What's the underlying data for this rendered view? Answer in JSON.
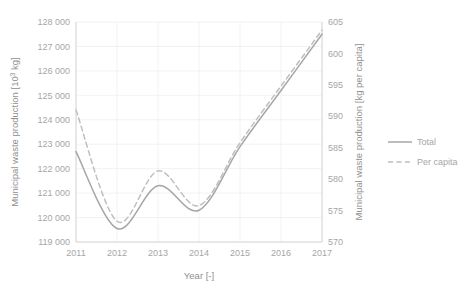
{
  "chart_data": {
    "type": "line",
    "title": "",
    "xlabel": "Year [-]",
    "ylabel": "Municipal waste production [10³ kg]",
    "ylabel_main": "Municipal waste production [10",
    "ylabel_sup": "3",
    "ylabel_tail": " kg]",
    "y2label": "Municipal waste production [kg per capita]",
    "x": [
      2011,
      2012,
      2013,
      2014,
      2015,
      2016,
      2017
    ],
    "categories": [
      "2011",
      "2012",
      "2013",
      "2014",
      "2015",
      "2016",
      "2017"
    ],
    "xtick_labels": [
      "2011",
      "2012",
      "2013",
      "2014",
      "2015",
      "2016",
      "2017"
    ],
    "ytick_labels": [
      "128 000",
      "127 000",
      "126 000",
      "125 000",
      "124 000",
      "123 000",
      "122 000",
      "121 000",
      "120 000",
      "119 000"
    ],
    "ytick_values": [
      128000,
      127000,
      126000,
      125000,
      124000,
      123000,
      122000,
      121000,
      120000,
      119000
    ],
    "y2tick_labels": [
      "605",
      "600",
      "595",
      "590",
      "585",
      "580",
      "575",
      "570"
    ],
    "y2tick_values": [
      605,
      600,
      595,
      590,
      585,
      580,
      575,
      570
    ],
    "ylim": [
      119000,
      128000
    ],
    "y2lim": [
      570,
      605
    ],
    "xlim": [
      2011,
      2017
    ],
    "grid": true,
    "legend_position": "right",
    "series": [
      {
        "name": "Total",
        "label": "Total",
        "axis": "left",
        "style": "solid",
        "color": "#a6a6a6",
        "values": [
          122700,
          119550,
          121300,
          120300,
          122900,
          125200,
          127500
        ]
      },
      {
        "name": "Per capita",
        "label": "Per capita",
        "axis": "right",
        "style": "dashed",
        "color": "#bfbfbf",
        "values": [
          591.0,
          573.3,
          581.3,
          575.8,
          585.8,
          594.8,
          603.7
        ]
      }
    ],
    "legend": [
      {
        "label": "Total",
        "style": "solid",
        "color": "#a6a6a6"
      },
      {
        "label": "Per capita",
        "style": "dashed",
        "color": "#bfbfbf"
      }
    ],
    "colors": {
      "total": "#a6a6a6",
      "per_capita": "#bfbfbf",
      "grid": "#eceff1",
      "axis": "#d4d4d4",
      "text": "#a6a6a6",
      "background": "#ffffff"
    },
    "plot_area": {
      "left": 76,
      "right": 322,
      "top": 22,
      "bottom": 242
    }
  }
}
